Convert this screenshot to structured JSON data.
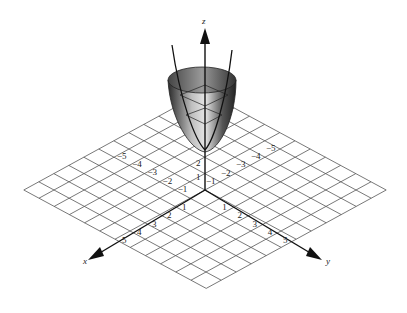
{
  "figure": {
    "grid_range": [
      -6,
      6
    ],
    "axes": {
      "x": {
        "label": "x",
        "ticks": [
          "-5",
          "-4",
          "-3",
          "-2",
          "-1",
          "1",
          "2",
          "3",
          "4",
          "5"
        ]
      },
      "y": {
        "label": "y",
        "ticks": [
          "-5",
          "-4",
          "-3",
          "-2",
          "-1",
          "1",
          "2",
          "3",
          "4",
          "5"
        ]
      },
      "z": {
        "label": "z",
        "ticks": [
          "1",
          "2"
        ]
      }
    },
    "colors": {
      "grid": "#555555",
      "axis": "#111111",
      "surface_dark": "#1a1a1a",
      "surface_light": "#d8d8d8"
    }
  }
}
